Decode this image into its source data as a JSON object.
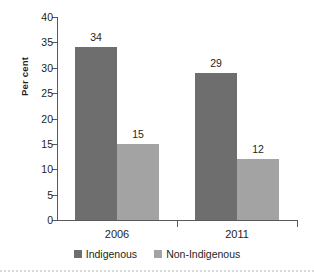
{
  "chart_data": {
    "type": "bar",
    "title": "",
    "subtitle": "",
    "xlabel": "",
    "ylabel": "Per cent",
    "categories": [
      "2006",
      "2011"
    ],
    "series": [
      {
        "name": "Indigenous",
        "color": "#6e6e6e",
        "values": [
          34,
          15
        ]
      },
      {
        "name": "Non-Indigenous",
        "color": "#a3a3a3",
        "values": [
          29,
          12
        ]
      }
    ],
    "grouped_values": [
      {
        "category": "2006",
        "bars": [
          {
            "series": "Indigenous",
            "value": 34,
            "label": "34"
          },
          {
            "series": "Non-Indigenous",
            "value": 15,
            "label": "15"
          }
        ]
      },
      {
        "category": "2011",
        "bars": [
          {
            "series": "Indigenous",
            "value": 29,
            "label": "29"
          },
          {
            "series": "Non-Indigenous",
            "value": 12,
            "label": "12"
          }
        ]
      }
    ],
    "ylim": [
      0,
      40
    ],
    "ytick_step": 5,
    "ytick_labels": [
      "0",
      "5",
      "10",
      "15",
      "20",
      "25",
      "30",
      "35",
      "40"
    ],
    "grid": false,
    "legend_position": "bottom",
    "legend_entries": [
      "Indigenous",
      "Non-Indigenous"
    ],
    "annotations": [
      "34",
      "15",
      "29",
      "12"
    ],
    "colors": {
      "series_indigenous": "#6e6e6e",
      "series_non_indigenous": "#a3a3a3",
      "axis": "#58595b",
      "text": "#231f20",
      "background": "#ffffff"
    }
  },
  "axis": {
    "y_label": "Per cent",
    "ticks": [
      {
        "value": 40,
        "label": "40"
      },
      {
        "value": 35,
        "label": "35"
      },
      {
        "value": 30,
        "label": "30"
      },
      {
        "value": 25,
        "label": "25"
      },
      {
        "value": 20,
        "label": "20"
      },
      {
        "value": 15,
        "label": "15"
      },
      {
        "value": 10,
        "label": "10"
      },
      {
        "value": 5,
        "label": "5"
      },
      {
        "value": 0,
        "label": "0"
      }
    ]
  },
  "categories": [
    {
      "label": "2006"
    },
    {
      "label": "2011"
    }
  ],
  "bars": [
    {
      "name": "bar-2006-indigenous",
      "series": 0,
      "group": 0,
      "value": 34,
      "label": "34"
    },
    {
      "name": "bar-2006-non-indigenous",
      "series": 1,
      "group": 0,
      "value": 15,
      "label": "15"
    },
    {
      "name": "bar-2011-indigenous",
      "series": 0,
      "group": 1,
      "value": 29,
      "label": "29"
    },
    {
      "name": "bar-2011-non-indigenous",
      "series": 1,
      "group": 1,
      "value": 12,
      "label": "12"
    }
  ],
  "legend": {
    "items": [
      {
        "label": "Indigenous"
      },
      {
        "label": "Non-Indigenous"
      }
    ]
  }
}
